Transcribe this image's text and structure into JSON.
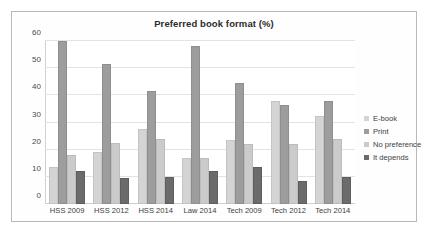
{
  "chart_data": {
    "type": "bar",
    "title": "Preferred book format (%)",
    "xlabel": "",
    "ylabel": "",
    "ylim": [
      0,
      60
    ],
    "yticks": [
      0,
      10,
      20,
      30,
      40,
      50,
      60
    ],
    "grid": true,
    "legend_position": "right",
    "categories": [
      "HSS 2009",
      "HSS 2012",
      "HSS 2014",
      "Law 2014",
      "Tech 2009",
      "Tech 2012",
      "Tech 2014"
    ],
    "series": [
      {
        "name": "E-book",
        "color": "#d4d4d4",
        "values": [
          13.5,
          19,
          27.5,
          17,
          23.5,
          38,
          32.5
        ]
      },
      {
        "name": "Print",
        "color": "#9d9d9d",
        "values": [
          60,
          51.5,
          41.5,
          58,
          44.5,
          36.5,
          38
        ]
      },
      {
        "name": "No preference",
        "color": "#cbcbcb",
        "values": [
          18,
          22.5,
          24,
          17,
          22,
          22,
          24
        ]
      },
      {
        "name": "It depends",
        "color": "#6b6b6b",
        "values": [
          12,
          9.5,
          10,
          12,
          13.5,
          8.5,
          10
        ]
      }
    ]
  }
}
